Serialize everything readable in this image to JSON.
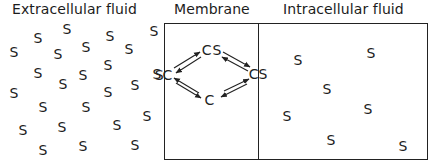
{
  "titles": {
    "extracellular": "Extracellular fluid",
    "membrane": "Membrane",
    "intracellular": "Intracellular fluid"
  },
  "substrate_symbol": "S",
  "carrier_species": {
    "loaded_outer": "SC",
    "loaded_top": "CS",
    "loaded_inner": "CS",
    "free_carrier": "C"
  },
  "extracellular_substrate_count": 25,
  "intracellular_substrate_count": 7,
  "reactions": [
    {
      "from": "SC",
      "to": "CS (top)",
      "direction": "reversible"
    },
    {
      "from": "CS (top)",
      "to": "CS (inner)",
      "direction": "reversible"
    },
    {
      "from": "CS (inner)",
      "to": "C",
      "direction": "reversible"
    },
    {
      "from": "C",
      "to": "SC",
      "direction": "reversible"
    }
  ]
}
